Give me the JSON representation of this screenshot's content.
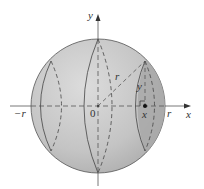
{
  "diagram": {
    "type": "sphere cross-sections",
    "axes": {
      "x_label": "x",
      "y_label": "y"
    },
    "labels": {
      "origin": "0",
      "neg_r": "−r",
      "pos_r": "r",
      "radius": "r",
      "height": "y",
      "point_x": "x"
    },
    "colors": {
      "sphere_fill": "#c8c8c8",
      "shaded_slice": "#a9a9a9",
      "outline": "#444444",
      "axis": "#555555"
    }
  }
}
